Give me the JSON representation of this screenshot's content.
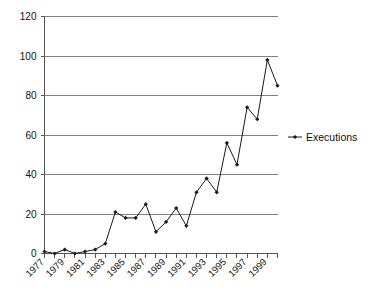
{
  "chart_data": {
    "type": "line",
    "title": "",
    "xlabel": "",
    "ylabel": "",
    "ylim": [
      0,
      120
    ],
    "yticks": [
      0,
      20,
      40,
      60,
      80,
      100,
      120
    ],
    "ytick_labels": [
      "0",
      "20",
      "40",
      "60",
      "80",
      "100",
      "120"
    ],
    "grid": true,
    "legend_position": "right",
    "x": [
      1977,
      1978,
      1979,
      1980,
      1981,
      1982,
      1983,
      1984,
      1985,
      1986,
      1987,
      1988,
      1989,
      1990,
      1991,
      1992,
      1993,
      1994,
      1995,
      1996,
      1997,
      1998,
      1999,
      2000
    ],
    "xtick_labels": [
      "1977",
      "1979",
      "1981",
      "1983",
      "1985",
      "1987",
      "1989",
      "1991",
      "1993",
      "1995",
      "1997",
      "1999"
    ],
    "xtick_years": [
      1977,
      1979,
      1981,
      1983,
      1985,
      1987,
      1989,
      1991,
      1993,
      1995,
      1997,
      1999
    ],
    "series": [
      {
        "name": "Executions",
        "marker": "filled-diamond",
        "color": "#1a1a1a",
        "values": [
          1,
          0,
          2,
          0,
          1,
          2,
          5,
          21,
          18,
          18,
          25,
          11,
          16,
          23,
          14,
          31,
          38,
          31,
          56,
          45,
          74,
          68,
          98,
          85
        ]
      }
    ]
  },
  "legend": {
    "entries": [
      {
        "label": "Executions"
      }
    ]
  },
  "axes": {
    "y_axis_name": "executions-count-axis",
    "x_axis_name": "year-axis"
  }
}
